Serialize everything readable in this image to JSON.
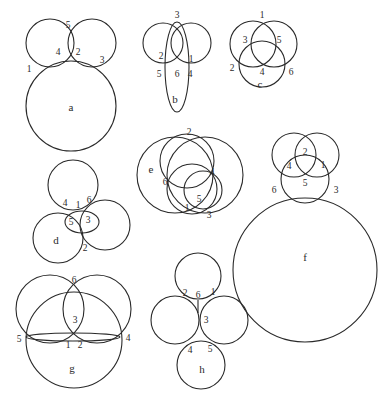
{
  "figures": [
    {
      "id": "a",
      "title": "a",
      "labels": [
        {
          "text": "1",
          "x": 29,
          "y": 72
        },
        {
          "text": "4",
          "x": 58,
          "y": 55
        },
        {
          "text": "5",
          "x": 68,
          "y": 28
        },
        {
          "text": "2",
          "x": 78,
          "y": 55
        },
        {
          "text": "3",
          "x": 102,
          "y": 63
        }
      ]
    },
    {
      "id": "b",
      "title": "b",
      "labels": [
        {
          "text": "3",
          "x": 177,
          "y": 18
        },
        {
          "text": "2",
          "x": 161,
          "y": 59
        },
        {
          "text": "1",
          "x": 191,
          "y": 62
        },
        {
          "text": "5",
          "x": 159,
          "y": 77
        },
        {
          "text": "6",
          "x": 177,
          "y": 77
        },
        {
          "text": "4",
          "x": 190,
          "y": 77
        }
      ]
    },
    {
      "id": "c",
      "title": "c",
      "labels": [
        {
          "text": "1",
          "x": 262,
          "y": 18
        },
        {
          "text": "3",
          "x": 245,
          "y": 43
        },
        {
          "text": "5",
          "x": 279,
          "y": 43
        },
        {
          "text": "2",
          "x": 232,
          "y": 71
        },
        {
          "text": "4",
          "x": 262,
          "y": 75
        },
        {
          "text": "6",
          "x": 291,
          "y": 75
        }
      ]
    },
    {
      "id": "d",
      "title": "d",
      "labels": [
        {
          "text": "4",
          "x": 65,
          "y": 206
        },
        {
          "text": "1",
          "x": 78,
          "y": 208
        },
        {
          "text": "6",
          "x": 89,
          "y": 203
        },
        {
          "text": "5",
          "x": 71,
          "y": 225
        },
        {
          "text": "3",
          "x": 88,
          "y": 223
        },
        {
          "text": "2",
          "x": 85,
          "y": 251
        }
      ]
    },
    {
      "id": "e",
      "title": "e",
      "labels": [
        {
          "text": "2",
          "x": 189,
          "y": 135
        },
        {
          "text": "6",
          "x": 165,
          "y": 185
        },
        {
          "text": "4",
          "x": 212,
          "y": 175
        },
        {
          "text": "5",
          "x": 199,
          "y": 202
        },
        {
          "text": "1",
          "x": 187,
          "y": 211
        },
        {
          "text": "3",
          "x": 209,
          "y": 218
        }
      ]
    },
    {
      "id": "f",
      "title": "f",
      "labels": [
        {
          "text": "2",
          "x": 305,
          "y": 155
        },
        {
          "text": "4",
          "x": 289,
          "y": 169
        },
        {
          "text": "1",
          "x": 323,
          "y": 168
        },
        {
          "text": "5",
          "x": 305,
          "y": 186
        },
        {
          "text": "6",
          "x": 274,
          "y": 193
        },
        {
          "text": "3",
          "x": 336,
          "y": 193
        }
      ]
    },
    {
      "id": "g",
      "title": "g",
      "labels": [
        {
          "text": "6",
          "x": 74,
          "y": 283
        },
        {
          "text": "3",
          "x": 75,
          "y": 323
        },
        {
          "text": "5",
          "x": 19,
          "y": 342
        },
        {
          "text": "1",
          "x": 68,
          "y": 348
        },
        {
          "text": "2",
          "x": 80,
          "y": 348
        },
        {
          "text": "4",
          "x": 128,
          "y": 341
        }
      ]
    },
    {
      "id": "h",
      "title": "h",
      "labels": [
        {
          "text": "2",
          "x": 185,
          "y": 296
        },
        {
          "text": "6",
          "x": 198,
          "y": 298
        },
        {
          "text": "1",
          "x": 213,
          "y": 295
        },
        {
          "text": "3",
          "x": 206,
          "y": 323
        },
        {
          "text": "4",
          "x": 190,
          "y": 353
        },
        {
          "text": "5",
          "x": 210,
          "y": 352
        }
      ]
    }
  ]
}
